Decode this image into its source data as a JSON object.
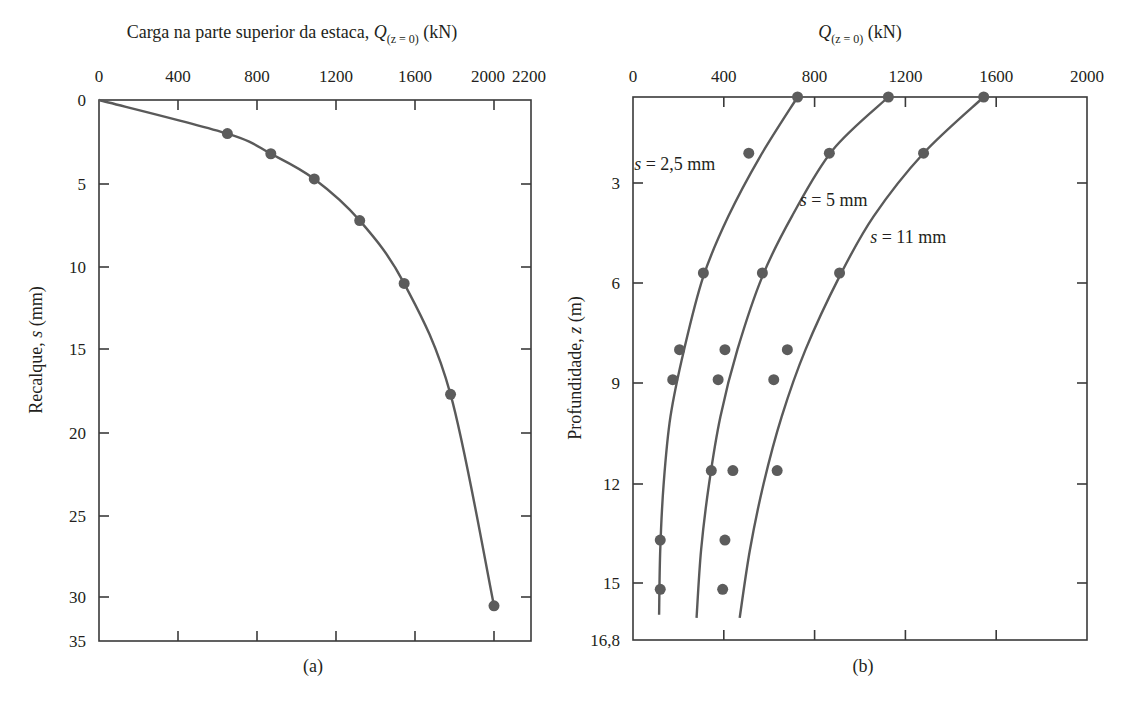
{
  "chart_data": [
    {
      "id": "a",
      "type": "line",
      "caption": "(a)",
      "title_prefix": "Carga na parte superior da estaca, ",
      "title_var": "Q",
      "title_sub": "(z = 0)",
      "title_unit": " (kN)",
      "xlabel": "Carga na parte superior da estaca, Q(z = 0) (kN)",
      "ylabel": "Recalque, s (mm)",
      "ylabel_prefix": "Recalque, ",
      "ylabel_var": "s",
      "ylabel_unit": " (mm)",
      "x_axis_position": "top",
      "y_axis_inverted": true,
      "xlim": [
        0,
        2200
      ],
      "ylim": [
        0,
        35
      ],
      "x_ticks": [
        0,
        400,
        800,
        1200,
        1600,
        2000,
        2200
      ],
      "y_ticks": [
        0,
        5,
        10,
        15,
        20,
        25,
        30,
        35
      ],
      "grid": false,
      "series": [
        {
          "name": "Carga x recalque",
          "curve": [
            [
              0,
              0
            ],
            [
              650,
              2.0
            ],
            [
              870,
              3.2
            ],
            [
              1090,
              4.7
            ],
            [
              1320,
              7.2
            ],
            [
              1545,
              11.0
            ],
            [
              1780,
              17.7
            ],
            [
              2000,
              31.0
            ]
          ],
          "points": [
            [
              650,
              2.0
            ],
            [
              870,
              3.2
            ],
            [
              1090,
              4.7
            ],
            [
              1320,
              7.2
            ],
            [
              1545,
              11.0
            ],
            [
              1780,
              17.7
            ],
            [
              2000,
              31.0
            ]
          ]
        }
      ]
    },
    {
      "id": "b",
      "type": "scatter",
      "caption": "(b)",
      "title_var": "Q",
      "title_sub": "(z = 0)",
      "title_unit": " (kN)",
      "xlabel": "Q(z = 0) (kN)",
      "ylabel": "Profundidade, z (m)",
      "ylabel_prefix": "Profundidade, ",
      "ylabel_var": "z",
      "ylabel_unit": " (m)",
      "x_axis_position": "top",
      "y_axis_inverted": true,
      "xlim": [
        0,
        2000
      ],
      "ylim": [
        0.4,
        16.8
      ],
      "x_ticks": [
        0,
        400,
        800,
        1200,
        1600,
        2000
      ],
      "y_ticks": [
        3,
        6,
        9,
        12,
        15,
        16.8
      ],
      "y_tick_labels": [
        "3",
        "6",
        "9",
        "12",
        "15",
        "16,8"
      ],
      "grid": false,
      "series": [
        {
          "name": "s = 2,5 mm",
          "label_var": "s",
          "label_text": " = 2,5 mm",
          "label_pos": [
            5,
            2.6
          ],
          "curve": [
            [
              725,
              0.4
            ],
            [
              560,
              2.2
            ],
            [
              420,
              4.0
            ],
            [
              310,
              5.8
            ],
            [
              225,
              8.0
            ],
            [
              165,
              10.0
            ],
            [
              135,
              12.0
            ],
            [
              120,
              14.0
            ],
            [
              115,
              16.0
            ]
          ],
          "points": [
            [
              725,
              0.4
            ],
            [
              510,
              2.1
            ],
            [
              310,
              5.7
            ],
            [
              205,
              8.0
            ],
            [
              175,
              8.9
            ],
            [
              120,
              13.7
            ],
            [
              120,
              15.2
            ]
          ]
        },
        {
          "name": "s = 5 mm",
          "label_var": "s",
          "label_text": " = 5 mm",
          "label_pos": [
            735,
            3.7
          ],
          "curve": [
            [
              1125,
              0.4
            ],
            [
              880,
              2.0
            ],
            [
              700,
              4.0
            ],
            [
              570,
              5.8
            ],
            [
              460,
              8.0
            ],
            [
              385,
              10.0
            ],
            [
              335,
              12.0
            ],
            [
              300,
              14.0
            ],
            [
              280,
              16.1
            ]
          ],
          "points": [
            [
              1125,
              0.4
            ],
            [
              865,
              2.1
            ],
            [
              570,
              5.7
            ],
            [
              405,
              8.0
            ],
            [
              375,
              8.9
            ],
            [
              345,
              11.6
            ],
            [
              440,
              11.6
            ],
            [
              405,
              13.7
            ],
            [
              395,
              15.2
            ]
          ]
        },
        {
          "name": "s = 11 mm",
          "label_var": "s",
          "label_text": " = 11 mm",
          "label_pos": [
            1045,
            4.8
          ],
          "curve": [
            [
              1545,
              0.4
            ],
            [
              1280,
              2.1
            ],
            [
              1060,
              4.0
            ],
            [
              910,
              5.8
            ],
            [
              760,
              8.0
            ],
            [
              655,
              10.0
            ],
            [
              575,
              12.0
            ],
            [
              515,
              14.0
            ],
            [
              470,
              16.1
            ]
          ],
          "points": [
            [
              1545,
              0.4
            ],
            [
              1280,
              2.1
            ],
            [
              910,
              5.7
            ],
            [
              680,
              8.0
            ],
            [
              620,
              8.9
            ],
            [
              635,
              11.6
            ]
          ]
        }
      ]
    }
  ]
}
